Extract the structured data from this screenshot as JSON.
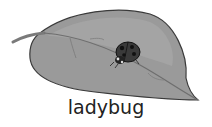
{
  "illustration": {
    "subject": "ladybug on a leaf",
    "caption": "ladybug",
    "colors": {
      "leaf_fill": "#9a9a9a",
      "leaf_light": "#b4b4b4",
      "leaf_outline": "#3a3a3a",
      "ladybug_body": "#2a2a2a",
      "ladybug_spots": "#111111",
      "caption": "#222222",
      "background": "#ffffff"
    }
  }
}
